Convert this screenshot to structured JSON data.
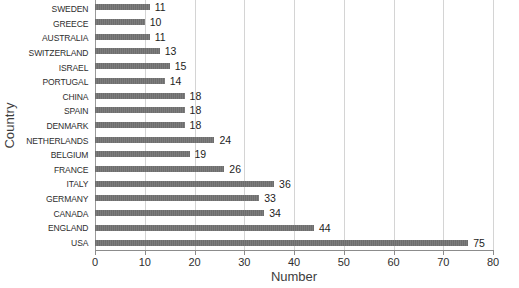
{
  "chart_data": {
    "type": "bar",
    "orientation": "horizontal",
    "title": "",
    "xlabel": "Number",
    "ylabel": "Country",
    "xlim": [
      0,
      80
    ],
    "xticks": [
      0,
      10,
      20,
      30,
      40,
      50,
      60,
      70,
      80
    ],
    "grid": true,
    "legend": false,
    "bar_color": "#757575",
    "data_labels": true,
    "categories": [
      "SWEDEN",
      "GREECE",
      "AUSTRALIA",
      "SWITZERLAND",
      "ISRAEL",
      "PORTUGAL",
      "CHINA",
      "SPAIN",
      "DENMARK",
      "NETHERLANDS",
      "BELGIUM",
      "FRANCE",
      "ITALY",
      "GERMANY",
      "CANADA",
      "ENGLAND",
      "USA"
    ],
    "values": [
      11,
      10,
      11,
      13,
      15,
      14,
      18,
      18,
      18,
      24,
      19,
      26,
      36,
      33,
      34,
      44,
      75
    ]
  }
}
